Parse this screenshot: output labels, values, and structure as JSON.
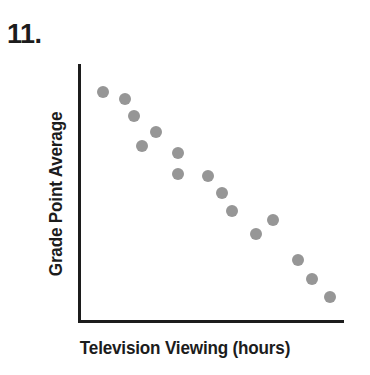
{
  "question": {
    "number_label": "11."
  },
  "chart_data": {
    "type": "scatter",
    "title": "",
    "xlabel": "Television Viewing (hours)",
    "ylabel": "Grade Point Average",
    "grid": false,
    "legend": null,
    "axes": {
      "x_ticks": [],
      "y_ticks": [],
      "xlim": [
        0,
        100
      ],
      "ylim": [
        0,
        100
      ],
      "note": "Axes are unlabeled schematic axes with no tick marks or numeric scale."
    },
    "relationship": "negative",
    "annotation": "Scatter plot showing a negative (decreasing) association between television viewing hours and grade point average.",
    "point_count": 15,
    "points": [
      {
        "x": 6,
        "y": 93
      },
      {
        "x": 15,
        "y": 90
      },
      {
        "x": 19,
        "y": 83
      },
      {
        "x": 28,
        "y": 76
      },
      {
        "x": 22,
        "y": 70
      },
      {
        "x": 37,
        "y": 67
      },
      {
        "x": 37,
        "y": 58
      },
      {
        "x": 49,
        "y": 57
      },
      {
        "x": 55,
        "y": 50
      },
      {
        "x": 59,
        "y": 42
      },
      {
        "x": 76,
        "y": 38
      },
      {
        "x": 69,
        "y": 32
      },
      {
        "x": 86,
        "y": 21
      },
      {
        "x": 92,
        "y": 13
      },
      {
        "x": 99,
        "y": 5
      }
    ],
    "colors": {
      "point": "#969696",
      "axis": "#1c1c1c",
      "background": "#ffffff"
    }
  }
}
